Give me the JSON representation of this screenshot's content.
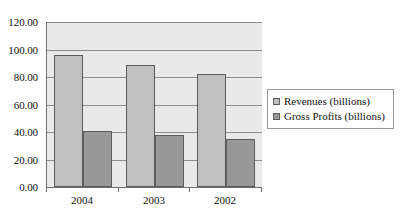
{
  "chart_data": {
    "type": "bar",
    "title": "",
    "subtitle": "",
    "xlabel": "",
    "ylabel": "",
    "categories": [
      "2004",
      "2003",
      "2002"
    ],
    "series": [
      {
        "name": "Revenues (billions)",
        "values": [
          96.0,
          89.0,
          82.0
        ],
        "color": "#c0c0c0"
      },
      {
        "name": "Gross Profits (billions)",
        "values": [
          41.0,
          38.0,
          35.0
        ],
        "color": "#989898"
      }
    ],
    "ylim": [
      0,
      120
    ],
    "y_ticks": [
      0,
      20,
      40,
      60,
      80,
      100,
      120
    ],
    "y_tick_labels": [
      "0.00",
      "20.00",
      "40.00",
      "60.00",
      "80.00",
      "100.00",
      "120.00"
    ],
    "grid": true,
    "grid_axis": "y",
    "legend": true,
    "legend_position": "right",
    "plot_background": "#e9e9e9",
    "figure_background": "#ffffff",
    "axis_color": "#6e6e6e",
    "gridline_color": "#8a8a8a"
  },
  "legend": {
    "entries": [
      {
        "label": "Revenues (billions)"
      },
      {
        "label": "Gross Profits (billions)"
      }
    ]
  }
}
